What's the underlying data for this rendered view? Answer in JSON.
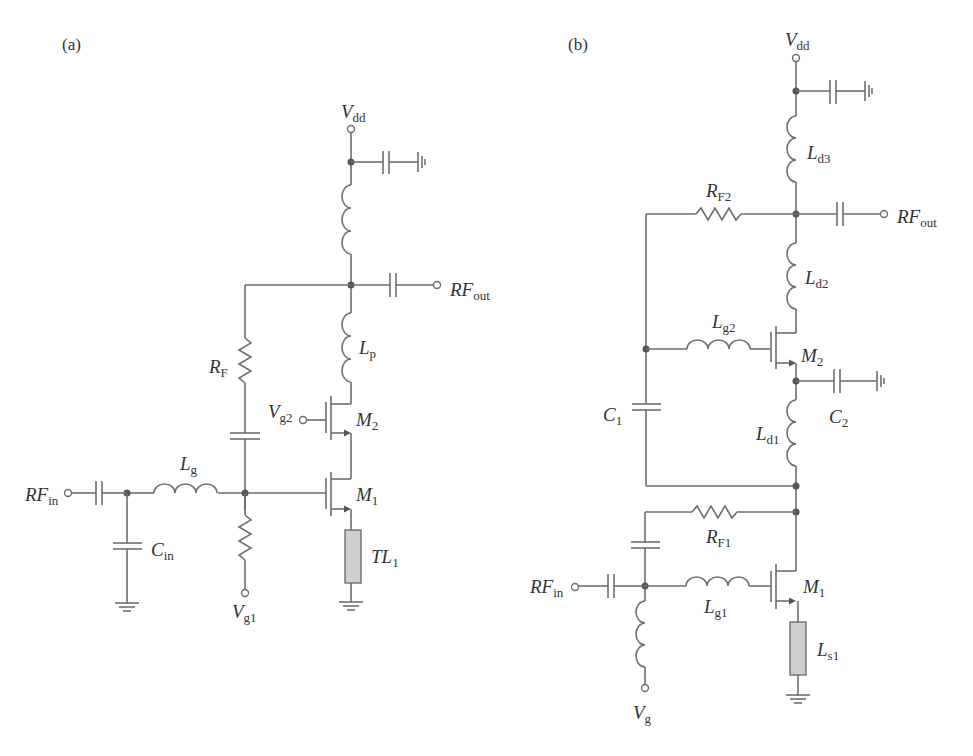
{
  "panels": [
    {
      "id": "a",
      "label": "(a)",
      "components": {
        "vdd": {
          "main": "V",
          "sub": "dd"
        },
        "rf_out": {
          "main": "RF",
          "sub": "out"
        },
        "rf_in": {
          "main": "RF",
          "sub": "in"
        },
        "rf": {
          "main": "R",
          "sub": "F"
        },
        "lp": {
          "main": "L",
          "sub": "p"
        },
        "vg2": {
          "main": "V",
          "sub": "g2"
        },
        "m2": {
          "main": "M",
          "sub": "2"
        },
        "m1": {
          "main": "M",
          "sub": "1"
        },
        "lg": {
          "main": "L",
          "sub": "g"
        },
        "cin": {
          "main": "C",
          "sub": "in"
        },
        "vg1": {
          "main": "V",
          "sub": "g1"
        },
        "tl1": {
          "main": "TL",
          "sub": "1"
        }
      }
    },
    {
      "id": "b",
      "label": "(b)",
      "components": {
        "vdd": {
          "main": "V",
          "sub": "dd"
        },
        "ld3": {
          "main": "L",
          "sub": "d3"
        },
        "rf2": {
          "main": "R",
          "sub": "F2"
        },
        "rf_out": {
          "main": "RF",
          "sub": "out"
        },
        "ld2": {
          "main": "L",
          "sub": "d2"
        },
        "lg2": {
          "main": "L",
          "sub": "g2"
        },
        "m2": {
          "main": "M",
          "sub": "2"
        },
        "c1": {
          "main": "C",
          "sub": "1"
        },
        "c2": {
          "main": "C",
          "sub": "2"
        },
        "ld1": {
          "main": "L",
          "sub": "d1"
        },
        "rf1": {
          "main": "R",
          "sub": "F1"
        },
        "rf_in": {
          "main": "RF",
          "sub": "in"
        },
        "m1": {
          "main": "M",
          "sub": "1"
        },
        "lg1": {
          "main": "L",
          "sub": "g1"
        },
        "ls1": {
          "main": "L",
          "sub": "s1"
        },
        "vg": {
          "main": "V",
          "sub": "g"
        }
      }
    }
  ],
  "colors": {
    "wire": "#6e6e6e",
    "node": "#555555",
    "transmission_line_fill": "#cfcfcf",
    "text": "#333333"
  }
}
